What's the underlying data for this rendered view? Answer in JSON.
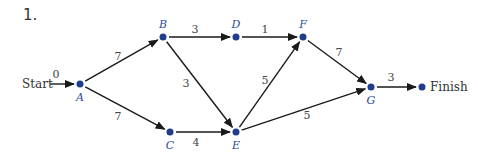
{
  "problem_number": "1.",
  "colors": {
    "node": "#1f3d8a",
    "edge": "#1a1a1a",
    "label": "#444444",
    "node_label": "#2a4a9a"
  },
  "nodes": [
    {
      "id": "A",
      "label": "A",
      "x": 80,
      "y": 84,
      "lx": 80,
      "ly": 101
    },
    {
      "id": "B",
      "label": "B",
      "x": 163,
      "y": 37,
      "lx": 163,
      "ly": 28
    },
    {
      "id": "C",
      "label": "C",
      "x": 170,
      "y": 132,
      "lx": 170,
      "ly": 149
    },
    {
      "id": "D",
      "label": "D",
      "x": 236,
      "y": 37,
      "lx": 236,
      "ly": 28
    },
    {
      "id": "E",
      "label": "E",
      "x": 236,
      "y": 132,
      "lx": 236,
      "ly": 149
    },
    {
      "id": "F",
      "label": "F",
      "x": 303,
      "y": 37,
      "lx": 303,
      "ly": 28
    },
    {
      "id": "G",
      "label": "G",
      "x": 371,
      "y": 87,
      "lx": 371,
      "ly": 104
    },
    {
      "id": "Finish",
      "label": "Finish",
      "x": 422,
      "y": 87,
      "lx": 430,
      "ly": 91
    }
  ],
  "start": {
    "label": "Start",
    "x": 22,
    "y": 88,
    "arrow_from": [
      50,
      84
    ]
  },
  "edges": [
    {
      "from": "Start",
      "to": "A",
      "weight": "0",
      "lx": 56,
      "ly": 78
    },
    {
      "from": "A",
      "to": "B",
      "weight": "7",
      "lx": 118,
      "ly": 60
    },
    {
      "from": "A",
      "to": "C",
      "weight": "7",
      "lx": 118,
      "ly": 120
    },
    {
      "from": "B",
      "to": "D",
      "weight": "3",
      "lx": 195,
      "ly": 33
    },
    {
      "from": "D",
      "to": "F",
      "weight": "1",
      "lx": 265,
      "ly": 33
    },
    {
      "from": "B",
      "to": "E",
      "weight": "3",
      "lx": 186,
      "ly": 87
    },
    {
      "from": "C",
      "to": "E",
      "weight": "4",
      "lx": 196,
      "ly": 146
    },
    {
      "from": "E",
      "to": "F",
      "weight": "5",
      "lx": 265,
      "ly": 84
    },
    {
      "from": "E",
      "to": "G",
      "weight": "5",
      "lx": 307,
      "ly": 119
    },
    {
      "from": "F",
      "to": "G",
      "weight": "7",
      "lx": 339,
      "ly": 56
    },
    {
      "from": "G",
      "to": "Finish",
      "weight": "3",
      "lx": 391,
      "ly": 81
    }
  ]
}
